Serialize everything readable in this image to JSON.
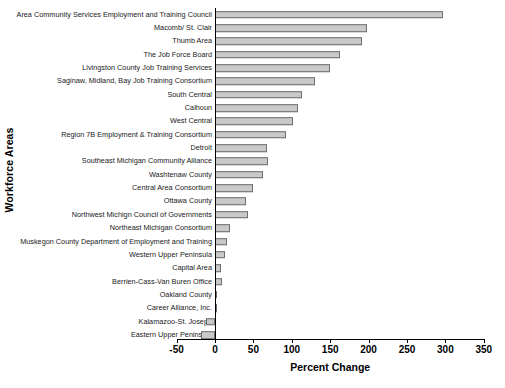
{
  "chart_data": {
    "type": "bar",
    "orientation": "horizontal",
    "title": "",
    "xlabel": "Percent Change",
    "ylabel": "Workforce Areas",
    "xlim": [
      -60,
      360
    ],
    "xticks": [
      -50,
      0,
      50,
      100,
      150,
      200,
      250,
      300,
      350
    ],
    "xtick_labels": [
      "-50",
      "0",
      "50",
      "100",
      "150",
      "200",
      "250",
      "300",
      "350"
    ],
    "grid": false,
    "legend": false,
    "bar_color": "#c9c9c9",
    "bar_edge_color": "#6e6e6e",
    "axis_color": "#000000",
    "categories": [
      "Area Community Services Employment and Training  Council",
      "Macomb/ St. Clair",
      "Thumb Area",
      "The Job Force Board",
      "Livingston County Job Training Services",
      "Saginaw, Midland, Bay Job Training Consortium",
      "South Central",
      "Calhoun",
      "West Central",
      "Region 7B Employment & Training Consortium",
      "Detroit",
      "Southeast Michigan Community Alliance",
      "Washtenaw County",
      "Central Area Consortium",
      "Ottawa County",
      "Northwest Michign Council of Governments",
      "Northeast Michigan Consortium",
      "Muskegon County Department of Employment and Training",
      "Western Upper Peninsula",
      "Capital Area",
      "Berrien-Cass-Van Buren Office",
      "Oakland County",
      "Career Alliance, Inc.",
      "Kalamazoo-St. Joseph",
      "Eastern Upper Peninsula"
    ],
    "values": [
      297,
      198,
      191,
      163,
      150,
      130,
      113,
      108,
      102,
      93,
      68,
      69,
      62,
      50,
      40,
      43,
      20,
      16,
      13,
      8,
      9,
      3,
      3,
      -12,
      -18
    ]
  }
}
